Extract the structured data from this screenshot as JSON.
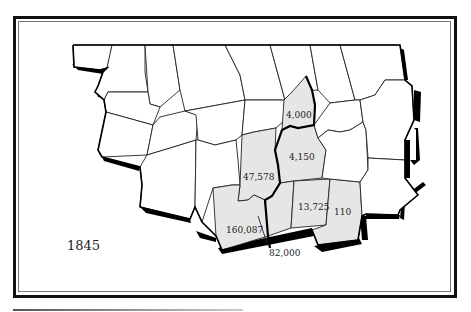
{
  "map": {
    "year": "1845",
    "shade_color": "#e6e6e6",
    "regions": [
      {
        "id": "a",
        "label": "4,000"
      },
      {
        "id": "b",
        "label": "4,150"
      },
      {
        "id": "c",
        "label": "47,578"
      },
      {
        "id": "d",
        "label": "160,087"
      },
      {
        "id": "e",
        "label": "82,000"
      },
      {
        "id": "f",
        "label": "13,725"
      },
      {
        "id": "g",
        "label": "110"
      }
    ]
  }
}
